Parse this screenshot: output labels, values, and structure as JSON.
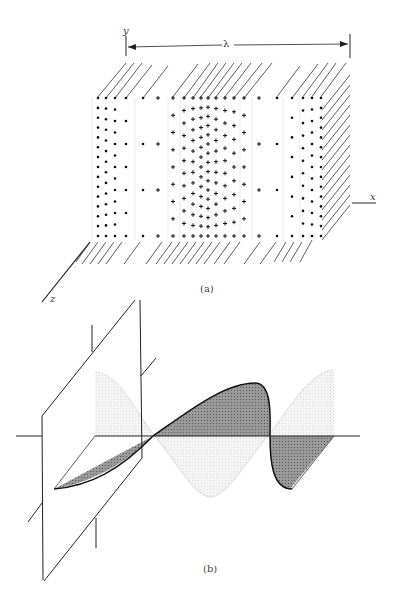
{
  "figure": {
    "part_a": {
      "caption": "(a)",
      "labels": {
        "y_axis": "y",
        "x_axis": "x",
        "z_axis": "z",
        "wavelength": "λ"
      },
      "charge_pattern": "dots and crosses in vertical sheets; density varies sinusoidally along x over one wavelength λ"
    },
    "part_b": {
      "caption": "(b)",
      "description": "transverse wave in plane intersecting a parallelogram (wavefront plane); dark shaded wave over horizontal axis with faint light wave in perpendicular plane"
    }
  }
}
